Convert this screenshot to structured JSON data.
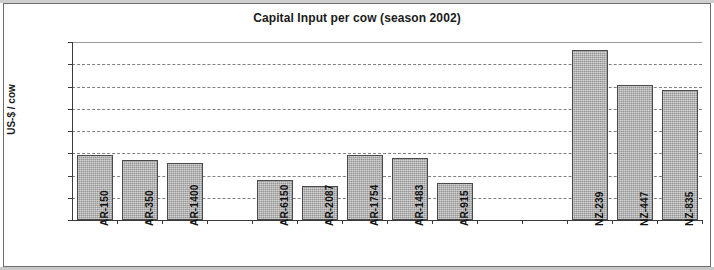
{
  "chart_data": {
    "type": "bar",
    "title": "Capital Input per cow (season 2002)",
    "xlabel": "",
    "ylabel": "US-$ / cow",
    "ylim": [
      0,
      1600
    ],
    "ytick_values": [
      0,
      200,
      400,
      600,
      800,
      1000,
      1200,
      1400,
      1600
    ],
    "ytick_labels": [
      "0",
      "200",
      "400",
      "600",
      "800",
      "1,000",
      "1,200",
      "1,400",
      "1,600"
    ],
    "grid": true,
    "legend": false,
    "categories": [
      "AR-150",
      "AR-350",
      "AR-1400",
      "",
      "AR-6150",
      "AR-2087",
      "AR-1754",
      "AR-1483",
      "AR-915",
      "",
      "",
      "NZ-239",
      "NZ-447",
      "NZ-835"
    ],
    "values": [
      585,
      540,
      510,
      null,
      360,
      310,
      580,
      555,
      330,
      null,
      null,
      1525,
      1215,
      1170
    ],
    "bar_color": "#aaaaaa",
    "bar_edge_color": "#4a4a4a",
    "gridline_color": "#808080",
    "axis_color": "#3a3a3a"
  }
}
